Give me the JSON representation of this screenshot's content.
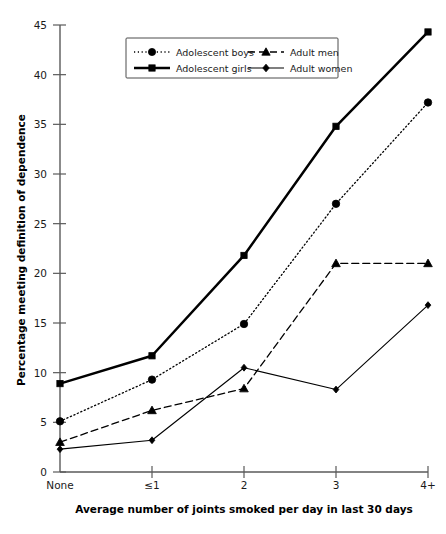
{
  "chart_data": {
    "type": "line",
    "title": "",
    "xlabel": "Average number of joints smoked per day in last 30 days",
    "ylabel": "Percentage meeting definition of dependence",
    "categories": [
      "None",
      "≤1",
      "2",
      "3",
      "4+"
    ],
    "ylim": [
      0,
      45
    ],
    "yticks": [
      0,
      5,
      10,
      15,
      20,
      25,
      30,
      35,
      40,
      45
    ],
    "grid": false,
    "legend_position": "top-center",
    "series": [
      {
        "name": "Adolescent boys",
        "values": [
          5.1,
          9.3,
          14.9,
          27.0,
          37.2
        ],
        "marker": "circle",
        "line_style": "dotted",
        "color": "#000000"
      },
      {
        "name": "Adolescent girls",
        "values": [
          8.9,
          11.7,
          21.8,
          34.8,
          44.3
        ],
        "marker": "square",
        "line_style": "solid-thick",
        "color": "#000000"
      },
      {
        "name": "Adult men",
        "values": [
          3.0,
          6.2,
          8.4,
          21.0,
          21.0
        ],
        "marker": "triangle",
        "line_style": "dashed",
        "color": "#000000"
      },
      {
        "name": "Adult women",
        "values": [
          2.3,
          3.2,
          10.5,
          8.3,
          16.8
        ],
        "marker": "diamond",
        "line_style": "solid-thin",
        "color": "#000000"
      }
    ]
  }
}
